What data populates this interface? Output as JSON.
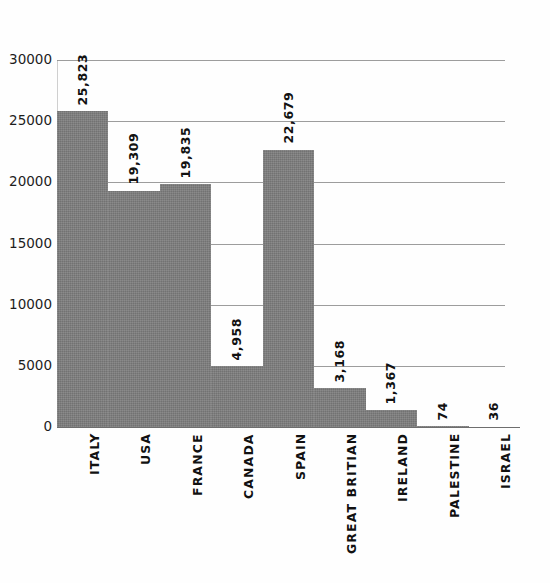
{
  "chart_data": {
    "type": "bar",
    "title": "",
    "subtitle": "",
    "xlabel": "",
    "ylabel": "",
    "orientation": "vertical",
    "grid": true,
    "legend": false,
    "legend_position": "none",
    "bar_color": "#7d7d7d",
    "ylim": [
      0,
      30000
    ],
    "ytick_labels": [
      "30000",
      "25000",
      "20000",
      "15000",
      "10000",
      "5000",
      "0"
    ],
    "ytick_values": [
      30000,
      25000,
      20000,
      15000,
      10000,
      5000,
      0
    ],
    "categories": [
      "ITALY",
      "USA",
      "FRANCE",
      "CANADA",
      "SPAIN",
      "GREAT BRITIAN",
      "IRELAND",
      "PALESTINE",
      "ISRAEL"
    ],
    "values": [
      25823,
      19309,
      19835,
      4958,
      22679,
      3168,
      1367,
      74,
      36
    ],
    "value_labels": [
      "25,823",
      "19,309",
      "19,835",
      "4,958",
      "22,679",
      "3,168",
      "1,367",
      "74",
      "36"
    ]
  }
}
